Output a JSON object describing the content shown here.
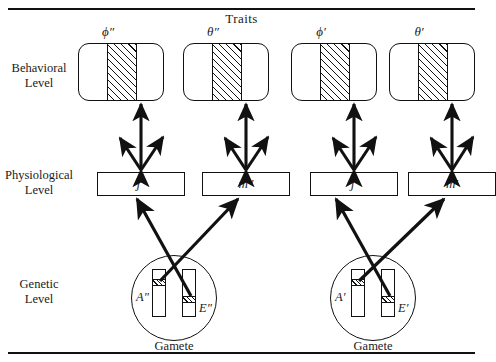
{
  "figure": {
    "title": "Traits",
    "level_labels": {
      "behavioral": "Behavioral\nLevel",
      "behavioral_line1": "Behavioral",
      "behavioral_line2": "Level",
      "physiological_line1": "Physiological",
      "physiological_line2": "Level",
      "genetic_line1": "Genetic",
      "genetic_line2": "Level"
    },
    "ink_color": "#111111",
    "background_color": "#ffffff"
  },
  "columns": [
    {
      "trait_label": "ϕ″",
      "physiological_label": "j″"
    },
    {
      "trait_label": "θ″",
      "physiological_label": "m″"
    },
    {
      "trait_label": "ϕ′",
      "physiological_label": "j′"
    },
    {
      "trait_label": "θ′",
      "physiological_label": "m′"
    }
  ],
  "gametes": [
    {
      "caption": "Gamete",
      "left_allele": "A″",
      "right_allele": "E″"
    },
    {
      "caption": "Gamete",
      "left_allele": "A′",
      "right_allele": "E′"
    }
  ]
}
